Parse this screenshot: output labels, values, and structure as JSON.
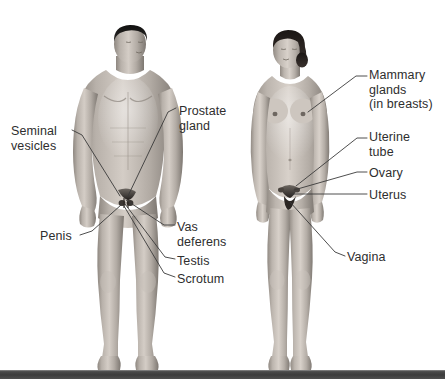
{
  "figure": {
    "type": "anatomical-illustration",
    "background_color": "#ffffff",
    "text_color": "#2e2e2e",
    "floor_color": "#3c3c3c",
    "bodies": [
      {
        "name": "male-figure",
        "sex": "male",
        "view": "anterior",
        "skin_tone": "#b9b2ab"
      },
      {
        "name": "female-figure",
        "sex": "female",
        "view": "anterior",
        "skin_tone": "#bdb6af"
      }
    ]
  },
  "labels": {
    "male": [
      {
        "id": "prostate-gland",
        "text": "Prostate\ngland",
        "x": 179,
        "y": 104,
        "align": "left"
      },
      {
        "id": "seminal-vesicles",
        "text": "Seminal\nvesicles",
        "x": 11,
        "y": 124,
        "align": "left"
      },
      {
        "id": "penis",
        "text": "Penis",
        "x": 40,
        "y": 229,
        "align": "left"
      },
      {
        "id": "vas-deferens",
        "text": "Vas\ndeferens",
        "x": 177,
        "y": 220,
        "align": "left"
      },
      {
        "id": "testis",
        "text": "Testis",
        "x": 177,
        "y": 254,
        "align": "left"
      },
      {
        "id": "scrotum",
        "text": "Scrotum",
        "x": 177,
        "y": 272,
        "align": "left"
      }
    ],
    "female": [
      {
        "id": "mammary-glands",
        "text": "Mammary\nglands\n(in breasts)",
        "x": 369,
        "y": 68,
        "align": "left"
      },
      {
        "id": "uterine-tube",
        "text": "Uterine\ntube",
        "x": 369,
        "y": 130,
        "align": "left"
      },
      {
        "id": "ovary",
        "text": "Ovary",
        "x": 369,
        "y": 166,
        "align": "left"
      },
      {
        "id": "uterus",
        "text": "Uterus",
        "x": 369,
        "y": 188,
        "align": "left"
      },
      {
        "id": "vagina",
        "text": "Vagina",
        "x": 347,
        "y": 250,
        "align": "left"
      }
    ]
  },
  "leaders": {
    "male": [
      {
        "id": "leader-prostate-gland",
        "points": "176,108 168,112 128,196"
      },
      {
        "id": "leader-seminal-vesicles",
        "points": "72,130 82,135 120,196"
      },
      {
        "id": "leader-penis",
        "points": "80,235 92,231 121,205"
      },
      {
        "id": "leader-vas-deferens",
        "points": "175,225 164,225 126,200"
      },
      {
        "id": "leader-testis",
        "points": "175,259 165,257 125,204"
      },
      {
        "id": "leader-scrotum",
        "points": "175,277 164,273 124,206"
      }
    ],
    "female": [
      {
        "id": "leader-mammary-glands",
        "points": "367,76 356,76 308,112"
      },
      {
        "id": "leader-uterine-tube",
        "points": "367,138 357,138 296,186"
      },
      {
        "id": "leader-ovary",
        "points": "367,172 357,172 294,190"
      },
      {
        "id": "leader-uterus",
        "points": "367,194 357,194 292,194"
      },
      {
        "id": "leader-vagina",
        "points": "345,256 335,252 290,202"
      }
    ]
  }
}
